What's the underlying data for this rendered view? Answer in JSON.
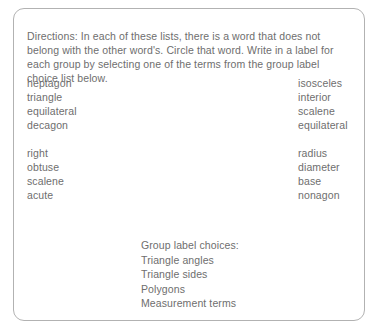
{
  "worksheet": {
    "directions": "Directions: In each of these lists, there is a word that does not belong with the other word's. Circle that word. Write in a label for each group by selecting one of the terms from the group label choice list below.",
    "columns": {
      "left": {
        "groups": [
          {
            "words": [
              "heptagon",
              "triangle",
              "equilateral",
              "decagon"
            ]
          },
          {
            "words": [
              "right",
              "obtuse",
              "scalene",
              "acute"
            ]
          }
        ]
      },
      "right": {
        "groups": [
          {
            "words": [
              "isosceles",
              "interior",
              "scalene",
              "equilateral"
            ]
          },
          {
            "words": [
              "radius",
              "diameter",
              "base",
              "nonagon"
            ]
          }
        ]
      }
    },
    "group_label_choices": {
      "heading": "Group label choices:",
      "options": [
        "Triangle angles",
        "Triangle sides",
        "Polygons",
        "Measurement terms"
      ]
    },
    "style": {
      "text_color": "#6e6e6e",
      "border_color": "#b2b2b2",
      "background_color": "#ffffff"
    }
  }
}
